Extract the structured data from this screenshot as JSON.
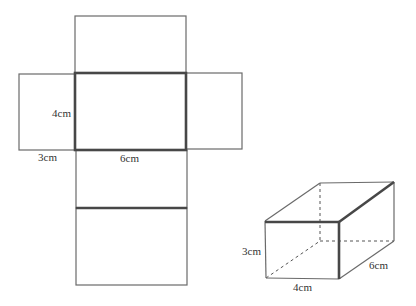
{
  "diagram": {
    "net": {
      "faces": [
        {
          "name": "top-flap",
          "x": 75,
          "y": 16,
          "w": 111,
          "h": 57
        },
        {
          "name": "left-flap",
          "x": 19,
          "y": 74,
          "w": 56,
          "h": 76
        },
        {
          "name": "center-face",
          "x": 75,
          "y": 73,
          "w": 111,
          "h": 77
        },
        {
          "name": "right-flap",
          "x": 186,
          "y": 73,
          "w": 56,
          "h": 76
        },
        {
          "name": "lower-face",
          "x": 76,
          "y": 150,
          "w": 111,
          "h": 58
        },
        {
          "name": "bottom-face",
          "x": 76,
          "y": 208,
          "w": 111,
          "h": 77
        }
      ],
      "labels": {
        "height": "4cm",
        "width_left": "3cm",
        "length": "6cm"
      }
    },
    "box": {
      "labels": {
        "height": "3cm",
        "width": "4cm",
        "depth": "6cm"
      }
    },
    "colors": {
      "thin_line": "#6a6a6a",
      "thick_line": "#474747",
      "text": "#333333"
    }
  }
}
